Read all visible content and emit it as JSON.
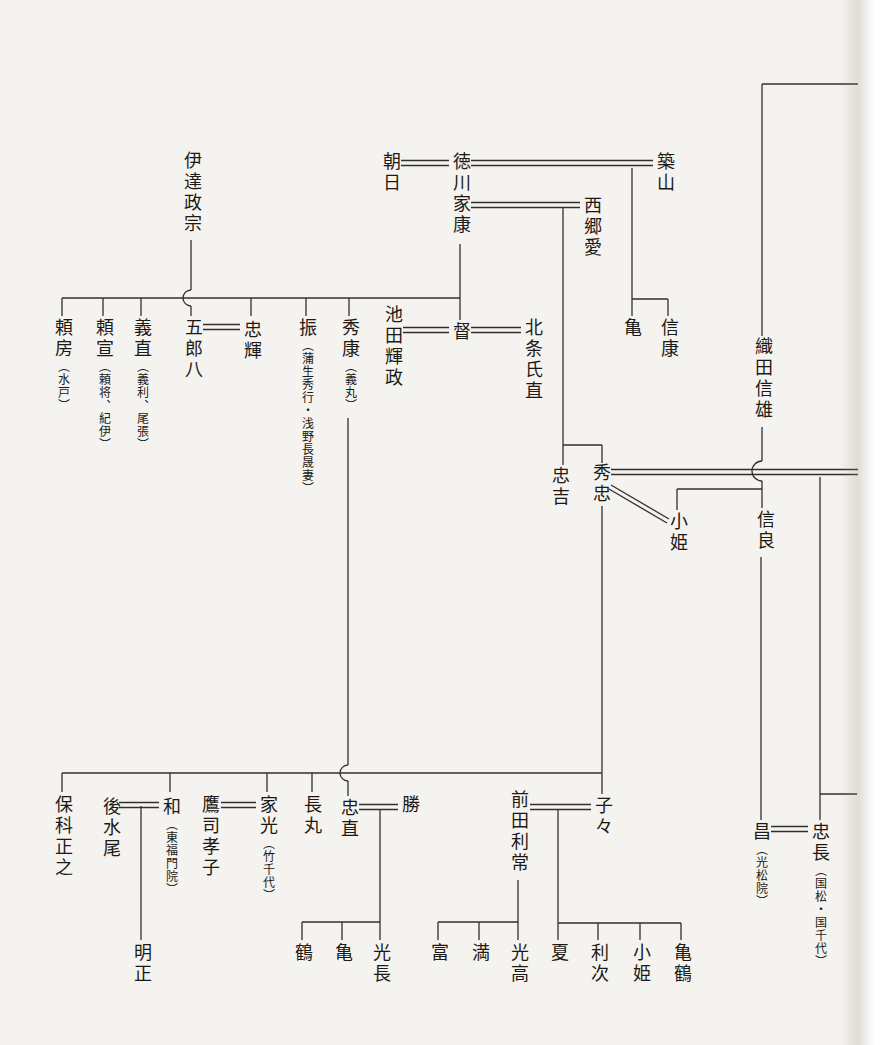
{
  "figure": {
    "kind": "family-tree",
    "line_color": "#332f2a",
    "paper_color": "#f5f3ef",
    "notation": {
      "double_line": "marriage",
      "single_line": "descent",
      "arc": "line-crossing-hop"
    }
  },
  "persons": {
    "date_masamune": {
      "name": "伊達政宗"
    },
    "asahi": {
      "name": "朝日"
    },
    "tokugawa_ieyasu": {
      "name": "徳川家康"
    },
    "tsukiyama": {
      "name": "築山"
    },
    "saigo_ai": {
      "name": "西郷愛"
    },
    "yorifusa": {
      "name": "頼房",
      "note": "（水戸）"
    },
    "yorinobu": {
      "name": "頼宣",
      "note": "（頼将、紀伊）"
    },
    "yoshinao": {
      "name": "義直",
      "note": "（義利、尾張）"
    },
    "iroha": {
      "name": "五郎八"
    },
    "tadateru": {
      "name": "忠輝"
    },
    "furi": {
      "name": "振",
      "note": "（蒲生秀行・浅野長晟妻）"
    },
    "hideyasu": {
      "name": "秀康",
      "note": "（義丸）"
    },
    "ikeda_terumasa": {
      "name": "池田輝政"
    },
    "toku": {
      "name": "督"
    },
    "hojo_ujinao": {
      "name": "北条氏直"
    },
    "kame": {
      "name": "亀"
    },
    "nobuyasu": {
      "name": "信康"
    },
    "oda_nobukatsu": {
      "name": "織田信雄"
    },
    "tadayoshi": {
      "name": "忠吉"
    },
    "hidetada": {
      "name": "秀忠"
    },
    "kohime_oda": {
      "name": "小姫"
    },
    "nobuyoshi": {
      "name": "信良"
    },
    "hoshina_masayuki": {
      "name": "保科正之"
    },
    "gomizunoo": {
      "name": "後水尾"
    },
    "kazu": {
      "name": "和",
      "note": "（東福門院）"
    },
    "takatsukasa_takako": {
      "name": "鷹司孝子"
    },
    "iemitsu": {
      "name": "家光",
      "note": "（竹千代）"
    },
    "nagamaru": {
      "name": "長丸"
    },
    "tadanao": {
      "name": "忠直"
    },
    "katsu": {
      "name": "勝"
    },
    "maeda_toshitsune": {
      "name": "前田利常"
    },
    "chiyo": {
      "name": "子々"
    },
    "masa": {
      "name": "昌",
      "note": "（光松院）"
    },
    "tadanaga": {
      "name": "忠長",
      "note": "（国松・国千代）"
    },
    "meisho": {
      "name": "明正"
    },
    "tsuru": {
      "name": "鶴"
    },
    "kame_2": {
      "name": "亀"
    },
    "mitsunaga": {
      "name": "光長"
    },
    "tomi": {
      "name": "富"
    },
    "mitsu": {
      "name": "満"
    },
    "mitsutaka": {
      "name": "光高"
    },
    "natsu": {
      "name": "夏"
    },
    "toshitsugu": {
      "name": "利次"
    },
    "kohime_maeda": {
      "name": "小姫"
    },
    "kametsuru": {
      "name": "亀鶴"
    }
  }
}
